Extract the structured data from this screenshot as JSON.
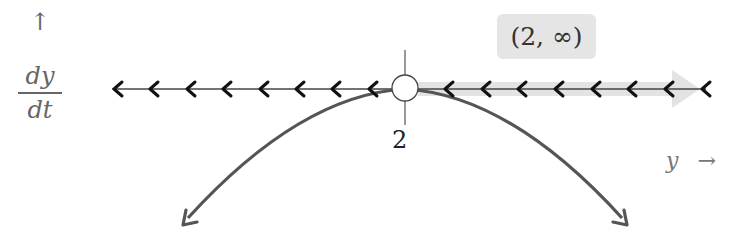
{
  "diagram": {
    "type": "phase-line",
    "vertical_label": {
      "arrow": "↑",
      "numerator": "dy",
      "denominator": "dt"
    },
    "horizontal_label": {
      "variable": "y",
      "arrow": "→"
    },
    "equilibrium": {
      "value": "2",
      "type": "semi-stable (open circle)"
    },
    "interval_label": "(2, ∞)",
    "left_flow_direction": "left",
    "right_flow_direction": "left",
    "left_chevron_count": 8,
    "right_chevron_count": 8,
    "curve": "downward parabola tangent to axis at y = 2",
    "colors": {
      "axis": "#222222",
      "curve": "#555555",
      "highlight": "#e0e0e0",
      "interval_box": "#e5e5e5"
    }
  }
}
